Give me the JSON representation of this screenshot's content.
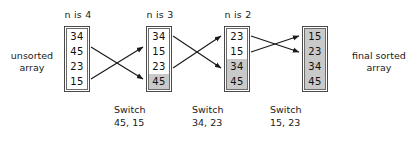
{
  "diagram": {
    "title_left": "unsorted\narray",
    "title_right": "final sorted\narray"
  },
  "labels": {
    "unsorted_line1": "unsorted",
    "unsorted_line2": "array",
    "final_line1": "final sorted",
    "final_line2": "array"
  },
  "steps": [
    {
      "header": "n is 4",
      "box_x": 64,
      "values": [
        "34",
        "45",
        "23",
        "15"
      ],
      "shaded": [
        false,
        false,
        false,
        false
      ]
    },
    {
      "header": "n is 3",
      "box_x": 146,
      "values": [
        "34",
        "15",
        "23",
        "45"
      ],
      "shaded": [
        false,
        false,
        false,
        true
      ]
    },
    {
      "header": "n is 2",
      "box_x": 224,
      "values": [
        "23",
        "15",
        "34",
        "45"
      ],
      "shaded": [
        false,
        false,
        true,
        true
      ]
    },
    {
      "header": "",
      "box_x": 302,
      "values": [
        "15",
        "23",
        "34",
        "45"
      ],
      "shaded": [
        true,
        true,
        true,
        true
      ]
    }
  ],
  "switches": [
    {
      "title": "Switch",
      "pair": "45, 15",
      "x": 114
    },
    {
      "title": "Switch",
      "pair": "34, 23",
      "x": 192
    },
    {
      "title": "Switch",
      "pair": "15, 23",
      "x": 270
    }
  ],
  "colors": {
    "shade": "#c9c9c9",
    "border": "#4a4a4a",
    "text": "#111111",
    "arrow": "#1a1a1a",
    "background": "#ffffff"
  },
  "icons": {
    "arrow": "arrow-right-icon"
  }
}
